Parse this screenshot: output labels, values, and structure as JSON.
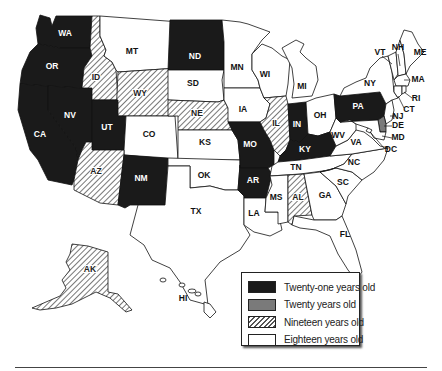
{
  "legend": {
    "items": [
      {
        "key": "21",
        "label": "Twenty-one years old",
        "color": "#1a1a1a"
      },
      {
        "key": "20",
        "label": "Twenty years old",
        "color": "#7a7a7a"
      },
      {
        "key": "19",
        "label": "Nineteen years old",
        "pattern": "diagonal-hatch"
      },
      {
        "key": "18",
        "label": "Eighteen years old",
        "color": "#ffffff"
      }
    ]
  },
  "states": {
    "WA": {
      "label": "WA",
      "category": "21"
    },
    "OR": {
      "label": "OR",
      "category": "21"
    },
    "CA": {
      "label": "CA",
      "category": "21"
    },
    "NV": {
      "label": "NV",
      "category": "21"
    },
    "ID": {
      "label": "ID",
      "category": "19"
    },
    "MT": {
      "label": "MT",
      "category": "18"
    },
    "WY": {
      "label": "WY",
      "category": "19"
    },
    "UT": {
      "label": "UT",
      "category": "21"
    },
    "CO": {
      "label": "CO",
      "category": "18"
    },
    "AZ": {
      "label": "AZ",
      "category": "19"
    },
    "NM": {
      "label": "NM",
      "category": "21"
    },
    "ND": {
      "label": "ND",
      "category": "21"
    },
    "SD": {
      "label": "SD",
      "category": "18"
    },
    "NE": {
      "label": "NE",
      "category": "19"
    },
    "KS": {
      "label": "KS",
      "category": "18"
    },
    "OK": {
      "label": "OK",
      "category": "18"
    },
    "TX": {
      "label": "TX",
      "category": "18"
    },
    "MN": {
      "label": "MN",
      "category": "18"
    },
    "IA": {
      "label": "IA",
      "category": "18"
    },
    "MO": {
      "label": "MO",
      "category": "21"
    },
    "AR": {
      "label": "AR",
      "category": "21"
    },
    "LA": {
      "label": "LA",
      "category": "18"
    },
    "WI": {
      "label": "WI",
      "category": "18"
    },
    "IL": {
      "label": "IL",
      "category": "19"
    },
    "MI": {
      "label": "MI",
      "category": "18"
    },
    "IN": {
      "label": "IN",
      "category": "21"
    },
    "OH": {
      "label": "OH",
      "category": "18"
    },
    "KY": {
      "label": "KY",
      "category": "21"
    },
    "TN": {
      "label": "TN",
      "category": "18"
    },
    "MS": {
      "label": "MS",
      "category": "18"
    },
    "AL": {
      "label": "AL",
      "category": "19"
    },
    "GA": {
      "label": "GA",
      "category": "18"
    },
    "FL": {
      "label": "FL",
      "category": "18"
    },
    "SC": {
      "label": "SC",
      "category": "18"
    },
    "NC": {
      "label": "NC",
      "category": "18"
    },
    "VA": {
      "label": "VA",
      "category": "18"
    },
    "WV": {
      "label": "WV",
      "category": "18"
    },
    "PA": {
      "label": "PA",
      "category": "21"
    },
    "NY": {
      "label": "NY",
      "category": "18"
    },
    "VT": {
      "label": "VT",
      "category": "18"
    },
    "NH": {
      "label": "NH",
      "category": "18"
    },
    "ME": {
      "label": "ME",
      "category": "18"
    },
    "MA": {
      "label": "MA",
      "category": "18"
    },
    "RI": {
      "label": "RI",
      "category": "18"
    },
    "CT": {
      "label": "CT",
      "category": "18"
    },
    "NJ": {
      "label": "NJ",
      "category": "18"
    },
    "DE": {
      "label": "DE",
      "category": "20"
    },
    "MD": {
      "label": "MD",
      "category": "18"
    },
    "DC": {
      "label": "DC",
      "category": "18"
    },
    "AK": {
      "label": "AK",
      "category": "19"
    },
    "HI": {
      "label": "HI",
      "category": "18"
    }
  },
  "colors": {
    "twenty_one": "#1a1a1a",
    "twenty": "#7a7a7a",
    "eighteen": "#ffffff",
    "outline": "#111111"
  }
}
